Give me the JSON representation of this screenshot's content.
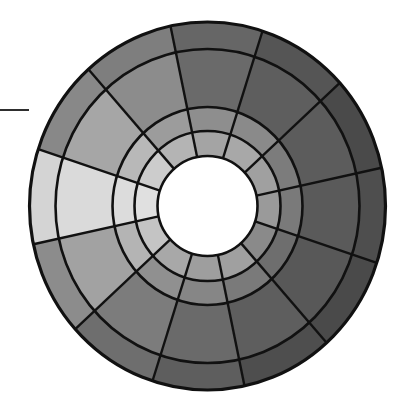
{
  "diagram": {
    "type": "segmented-ring-wheel",
    "sector_count": 12,
    "band_count": 4,
    "sector_start_angle_deg": 342,
    "sector_span_deg": 30,
    "outline_color": "#111111",
    "center_fill": "#ffffff",
    "leader_line_color": "#2e2e2e",
    "bands_inner_to_outer": [
      "inner",
      "middle",
      "wide",
      "outer"
    ],
    "sectors": [
      {
        "id": "s0",
        "label": "right",
        "shades": [
          "#9a9a9a",
          "#7a7a7a",
          "#5a5a5a",
          "#4e4e4e"
        ]
      },
      {
        "id": "s1",
        "label": "upper-right-1",
        "shades": [
          "#a0a0a0",
          "#7c7c7c",
          "#5c5c5c",
          "#4a4a4a"
        ]
      },
      {
        "id": "s2",
        "label": "upper-right-2",
        "shades": [
          "#a8a8a8",
          "#8a8a8a",
          "#5e5e5e",
          "#555555"
        ]
      },
      {
        "id": "s3",
        "label": "top",
        "shades": [
          "#a4a4a4",
          "#8e8e8e",
          "#6a6a6a",
          "#666666"
        ]
      },
      {
        "id": "s4",
        "label": "upper-left-2",
        "shades": [
          "#b4b4b4",
          "#9c9c9c",
          "#8c8c8c",
          "#7e7e7e"
        ]
      },
      {
        "id": "s5",
        "label": "upper-left-1",
        "shades": [
          "#cccccc",
          "#b8b8b8",
          "#a6a6a6",
          "#888888"
        ]
      },
      {
        "id": "s6",
        "label": "left",
        "shades": [
          "#e0e0e0",
          "#dcdcdc",
          "#dadada",
          "#d4d4d4"
        ]
      },
      {
        "id": "s7",
        "label": "lower-left-1",
        "shades": [
          "#c4c4c4",
          "#b4b4b4",
          "#a2a2a2",
          "#8c8c8c"
        ]
      },
      {
        "id": "s8",
        "label": "lower-left-2",
        "shades": [
          "#a8a8a8",
          "#909090",
          "#7c7c7c",
          "#6e6e6e"
        ]
      },
      {
        "id": "s9",
        "label": "bottom",
        "shades": [
          "#9e9e9e",
          "#868686",
          "#6a6a6a",
          "#5e5e5e"
        ]
      },
      {
        "id": "s10",
        "label": "lower-right-2",
        "shades": [
          "#a0a0a0",
          "#7a7a7a",
          "#5e5e5e",
          "#4e4e4e"
        ]
      },
      {
        "id": "s11",
        "label": "lower-right-1",
        "shades": [
          "#8a8a8a",
          "#6e6e6e",
          "#585858",
          "#4a4a4a"
        ]
      }
    ]
  }
}
